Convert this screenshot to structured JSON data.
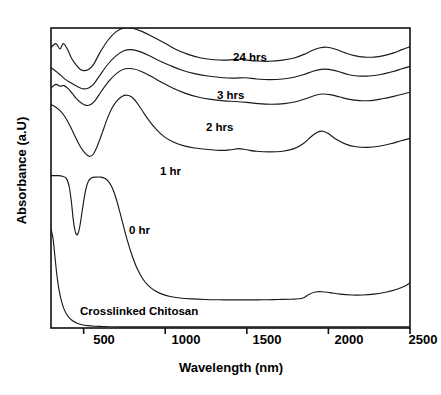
{
  "chart_data": {
    "type": "line",
    "title": "",
    "xlabel": "Wavelength (nm)",
    "ylabel": "Absorbance (a.U)",
    "xlim": [
      300,
      2500
    ],
    "ylim": [
      0,
      1
    ],
    "xticks": [
      500,
      1000,
      1500,
      2000,
      2500
    ],
    "xticklabels": [
      "500",
      "1000",
      "1500",
      "2000",
      "2500"
    ],
    "yticks": [],
    "yticklabels": [],
    "grid": false,
    "legend_position": "inline-annotations",
    "annotations": [
      {
        "text": "24 hrs",
        "x": 1260,
        "y": 0.905
      },
      {
        "text": "3 hrs",
        "x": 1145,
        "y": 0.778
      },
      {
        "text": "2 hrs",
        "x": 1080,
        "y": 0.672
      },
      {
        "text": "1 hr",
        "x": 905,
        "y": 0.525
      },
      {
        "text": "0 hr",
        "x": 700,
        "y": 0.318
      },
      {
        "text": "Crosslinked Chitosan",
        "x": 560,
        "y": 0.065
      }
    ],
    "series": [
      {
        "name": "24 hrs",
        "offset_note": "top trace, vertically offset",
        "points": [
          [
            300,
            0.935
          ],
          [
            330,
            0.948
          ],
          [
            355,
            0.93
          ],
          [
            375,
            0.948
          ],
          [
            400,
            0.93
          ],
          [
            425,
            0.9
          ],
          [
            455,
            0.876
          ],
          [
            480,
            0.862
          ],
          [
            505,
            0.858
          ],
          [
            530,
            0.862
          ],
          [
            560,
            0.878
          ],
          [
            600,
            0.918
          ],
          [
            650,
            0.96
          ],
          [
            700,
            0.988
          ],
          [
            750,
            1.0
          ],
          [
            800,
            0.999
          ],
          [
            860,
            0.988
          ],
          [
            920,
            0.972
          ],
          [
            990,
            0.952
          ],
          [
            1060,
            0.93
          ],
          [
            1140,
            0.912
          ],
          [
            1220,
            0.9
          ],
          [
            1300,
            0.894
          ],
          [
            1380,
            0.893
          ],
          [
            1450,
            0.896
          ],
          [
            1500,
            0.893
          ],
          [
            1560,
            0.89
          ],
          [
            1640,
            0.889
          ],
          [
            1720,
            0.893
          ],
          [
            1790,
            0.9
          ],
          [
            1850,
            0.912
          ],
          [
            1900,
            0.925
          ],
          [
            1950,
            0.934
          ],
          [
            1990,
            0.936
          ],
          [
            2040,
            0.93
          ],
          [
            2100,
            0.918
          ],
          [
            2160,
            0.908
          ],
          [
            2220,
            0.903
          ],
          [
            2280,
            0.903
          ],
          [
            2340,
            0.908
          ],
          [
            2400,
            0.917
          ],
          [
            2450,
            0.928
          ],
          [
            2500,
            0.938
          ]
        ]
      },
      {
        "name": "3 hrs",
        "points": [
          [
            300,
            0.868
          ],
          [
            330,
            0.856
          ],
          [
            360,
            0.842
          ],
          [
            390,
            0.828
          ],
          [
            420,
            0.818
          ],
          [
            450,
            0.808
          ],
          [
            480,
            0.8
          ],
          [
            505,
            0.797
          ],
          [
            530,
            0.8
          ],
          [
            560,
            0.812
          ],
          [
            600,
            0.843
          ],
          [
            650,
            0.88
          ],
          [
            700,
            0.908
          ],
          [
            750,
            0.925
          ],
          [
            790,
            0.928
          ],
          [
            840,
            0.922
          ],
          [
            900,
            0.908
          ],
          [
            960,
            0.892
          ],
          [
            1030,
            0.875
          ],
          [
            1100,
            0.86
          ],
          [
            1180,
            0.848
          ],
          [
            1260,
            0.84
          ],
          [
            1340,
            0.835
          ],
          [
            1420,
            0.833
          ],
          [
            1490,
            0.834
          ],
          [
            1560,
            0.83
          ],
          [
            1640,
            0.828
          ],
          [
            1720,
            0.83
          ],
          [
            1790,
            0.836
          ],
          [
            1850,
            0.845
          ],
          [
            1905,
            0.856
          ],
          [
            1955,
            0.862
          ],
          [
            2000,
            0.862
          ],
          [
            2060,
            0.855
          ],
          [
            2120,
            0.845
          ],
          [
            2180,
            0.84
          ],
          [
            2250,
            0.84
          ],
          [
            2320,
            0.845
          ],
          [
            2390,
            0.854
          ],
          [
            2450,
            0.864
          ],
          [
            2500,
            0.872
          ]
        ]
      },
      {
        "name": "2 hrs",
        "points": [
          [
            300,
            0.8
          ],
          [
            330,
            0.812
          ],
          [
            355,
            0.806
          ],
          [
            380,
            0.808
          ],
          [
            405,
            0.798
          ],
          [
            430,
            0.782
          ],
          [
            460,
            0.762
          ],
          [
            490,
            0.748
          ],
          [
            515,
            0.742
          ],
          [
            540,
            0.744
          ],
          [
            570,
            0.758
          ],
          [
            610,
            0.79
          ],
          [
            660,
            0.826
          ],
          [
            710,
            0.852
          ],
          [
            755,
            0.864
          ],
          [
            800,
            0.864
          ],
          [
            850,
            0.856
          ],
          [
            910,
            0.84
          ],
          [
            975,
            0.82
          ],
          [
            1045,
            0.8
          ],
          [
            1120,
            0.783
          ],
          [
            1200,
            0.77
          ],
          [
            1280,
            0.762
          ],
          [
            1360,
            0.757
          ],
          [
            1430,
            0.755
          ],
          [
            1500,
            0.752
          ],
          [
            1570,
            0.748
          ],
          [
            1650,
            0.746
          ],
          [
            1730,
            0.748
          ],
          [
            1800,
            0.754
          ],
          [
            1860,
            0.764
          ],
          [
            1915,
            0.775
          ],
          [
            1960,
            0.78
          ],
          [
            2010,
            0.778
          ],
          [
            2070,
            0.77
          ],
          [
            2130,
            0.762
          ],
          [
            2190,
            0.758
          ],
          [
            2260,
            0.758
          ],
          [
            2330,
            0.764
          ],
          [
            2400,
            0.772
          ],
          [
            2460,
            0.78
          ],
          [
            2500,
            0.786
          ]
        ]
      },
      {
        "name": "1 hr",
        "points": [
          [
            300,
            0.745
          ],
          [
            330,
            0.736
          ],
          [
            360,
            0.722
          ],
          [
            390,
            0.7
          ],
          [
            420,
            0.67
          ],
          [
            450,
            0.636
          ],
          [
            480,
            0.604
          ],
          [
            510,
            0.582
          ],
          [
            535,
            0.572
          ],
          [
            560,
            0.58
          ],
          [
            585,
            0.608
          ],
          [
            615,
            0.652
          ],
          [
            645,
            0.698
          ],
          [
            675,
            0.734
          ],
          [
            705,
            0.758
          ],
          [
            735,
            0.772
          ],
          [
            765,
            0.776
          ],
          [
            795,
            0.77
          ],
          [
            825,
            0.752
          ],
          [
            860,
            0.724
          ],
          [
            900,
            0.692
          ],
          [
            945,
            0.662
          ],
          [
            995,
            0.637
          ],
          [
            1050,
            0.62
          ],
          [
            1110,
            0.608
          ],
          [
            1180,
            0.6
          ],
          [
            1260,
            0.595
          ],
          [
            1340,
            0.592
          ],
          [
            1400,
            0.594
          ],
          [
            1450,
            0.598
          ],
          [
            1500,
            0.594
          ],
          [
            1560,
            0.589
          ],
          [
            1640,
            0.587
          ],
          [
            1720,
            0.589
          ],
          [
            1790,
            0.598
          ],
          [
            1845,
            0.614
          ],
          [
            1890,
            0.636
          ],
          [
            1930,
            0.652
          ],
          [
            1965,
            0.656
          ],
          [
            2000,
            0.648
          ],
          [
            2050,
            0.628
          ],
          [
            2110,
            0.612
          ],
          [
            2170,
            0.604
          ],
          [
            2240,
            0.602
          ],
          [
            2310,
            0.606
          ],
          [
            2380,
            0.614
          ],
          [
            2445,
            0.624
          ],
          [
            2500,
            0.632
          ]
        ]
      },
      {
        "name": "0 hr",
        "points": [
          [
            300,
            0.508
          ],
          [
            340,
            0.508
          ],
          [
            370,
            0.506
          ],
          [
            395,
            0.498
          ],
          [
            412,
            0.47
          ],
          [
            425,
            0.42
          ],
          [
            435,
            0.368
          ],
          [
            445,
            0.33
          ],
          [
            455,
            0.312
          ],
          [
            465,
            0.314
          ],
          [
            477,
            0.34
          ],
          [
            490,
            0.386
          ],
          [
            503,
            0.432
          ],
          [
            516,
            0.468
          ],
          [
            530,
            0.49
          ],
          [
            548,
            0.5
          ],
          [
            575,
            0.503
          ],
          [
            605,
            0.503
          ],
          [
            632,
            0.498
          ],
          [
            655,
            0.486
          ],
          [
            678,
            0.464
          ],
          [
            700,
            0.43
          ],
          [
            722,
            0.386
          ],
          [
            745,
            0.338
          ],
          [
            770,
            0.288
          ],
          [
            798,
            0.24
          ],
          [
            828,
            0.198
          ],
          [
            860,
            0.166
          ],
          [
            895,
            0.142
          ],
          [
            935,
            0.125
          ],
          [
            980,
            0.113
          ],
          [
            1030,
            0.105
          ],
          [
            1090,
            0.1
          ],
          [
            1160,
            0.097
          ],
          [
            1240,
            0.095
          ],
          [
            1330,
            0.094
          ],
          [
            1420,
            0.094
          ],
          [
            1510,
            0.094
          ],
          [
            1600,
            0.094
          ],
          [
            1690,
            0.095
          ],
          [
            1770,
            0.096
          ],
          [
            1840,
            0.099
          ],
          [
            1880,
            0.112
          ],
          [
            1920,
            0.12
          ],
          [
            1960,
            0.121
          ],
          [
            2010,
            0.118
          ],
          [
            2070,
            0.113
          ],
          [
            2140,
            0.11
          ],
          [
            2210,
            0.11
          ],
          [
            2280,
            0.113
          ],
          [
            2350,
            0.119
          ],
          [
            2420,
            0.129
          ],
          [
            2470,
            0.14
          ],
          [
            2500,
            0.15
          ]
        ]
      },
      {
        "name": "Crosslinked Chitosan",
        "points": [
          [
            300,
            0.33
          ],
          [
            312,
            0.3
          ],
          [
            322,
            0.25
          ],
          [
            332,
            0.196
          ],
          [
            342,
            0.152
          ],
          [
            353,
            0.116
          ],
          [
            366,
            0.086
          ],
          [
            380,
            0.063
          ],
          [
            396,
            0.046
          ],
          [
            414,
            0.033
          ],
          [
            435,
            0.023
          ],
          [
            460,
            0.016
          ],
          [
            490,
            0.011
          ],
          [
            525,
            0.008
          ],
          [
            565,
            0.006
          ],
          [
            615,
            0.005
          ],
          [
            680,
            0.004
          ],
          [
            760,
            0.004
          ],
          [
            860,
            0.004
          ],
          [
            980,
            0.004
          ],
          [
            1120,
            0.004
          ],
          [
            1300,
            0.004
          ],
          [
            1500,
            0.004
          ],
          [
            1750,
            0.004
          ],
          [
            2000,
            0.004
          ],
          [
            2250,
            0.004
          ],
          [
            2500,
            0.004
          ]
        ]
      }
    ]
  },
  "axes": {
    "xlabel": "Wavelength (nm)",
    "ylabel": "Absorbance (a.U)",
    "xtick_labels": [
      "500",
      "1000",
      "1500",
      "2000",
      "2500"
    ]
  },
  "curve_labels": {
    "l24": "24 hrs",
    "l3": "3 hrs",
    "l2": "2 hrs",
    "l1": "1 hr",
    "l0": "0 hr",
    "lchitosan": "Crosslinked Chitosan"
  },
  "colors": {
    "line": "#1a1a1a",
    "frame": "#111111",
    "background": "#ffffff",
    "text": "#000000"
  }
}
